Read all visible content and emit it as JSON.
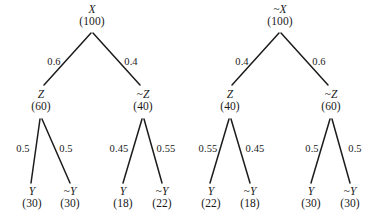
{
  "figure": {
    "type": "probability-tree-diagram",
    "background_color": "#ffffff",
    "ink_color": "#1c1c1c",
    "tree_count": 2
  },
  "trees": [
    {
      "name": "tree-x",
      "root": {
        "label": "X",
        "value": "(100)"
      },
      "level1": [
        {
          "label": "Z",
          "value": "(60)",
          "edge_prob": "0.6"
        },
        {
          "label": "~Z",
          "value": "(40)",
          "edge_prob": "0.4"
        }
      ],
      "leaves": [
        {
          "label": "Y",
          "value": "(30)",
          "edge_prob": "0.5"
        },
        {
          "label": "~Y",
          "value": "(30)",
          "edge_prob": "0.5"
        },
        {
          "label": "Y",
          "value": "(18)",
          "edge_prob": "0.45"
        },
        {
          "label": "~Y",
          "value": "(22)",
          "edge_prob": "0.55"
        }
      ]
    },
    {
      "name": "tree-not-x",
      "root": {
        "label": "~X",
        "value": "(100)"
      },
      "level1": [
        {
          "label": "Z",
          "value": "(40)",
          "edge_prob": "0.4"
        },
        {
          "label": "~Z",
          "value": "(60)",
          "edge_prob": "0.6"
        }
      ],
      "leaves": [
        {
          "label": "Y",
          "value": "(22)",
          "edge_prob": "0.55"
        },
        {
          "label": "~Y",
          "value": "(18)",
          "edge_prob": "0.45"
        },
        {
          "label": "Y",
          "value": "(30)",
          "edge_prob": "0.5"
        },
        {
          "label": "~Y",
          "value": "(30)",
          "edge_prob": "0.5"
        }
      ]
    }
  ]
}
